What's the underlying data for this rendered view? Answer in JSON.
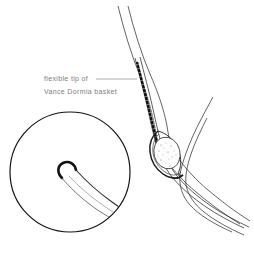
{
  "figure": {
    "background_color": "#ffffff",
    "width": 254,
    "height": 253,
    "ink_color": "#1a1a1a",
    "thin_line_color": "#444449",
    "text_color": "#7d7d82"
  },
  "annotation": {
    "line1": "flexible tip of",
    "line2": "Vance Dormia basket",
    "leader_label": "leader-line"
  },
  "parts": {
    "duct_wall_outer": "bile duct outer wall",
    "duct_wall_inner": "bile duct inner wall",
    "side_branch": "side branch duct",
    "catheter": "catheter sheath",
    "marker_band": "radiopaque marker band",
    "basket": "wire basket",
    "stone": "calculus stone",
    "inset_circle": "magnified detail circle",
    "inset_tip": "flexible wire tip curl"
  }
}
